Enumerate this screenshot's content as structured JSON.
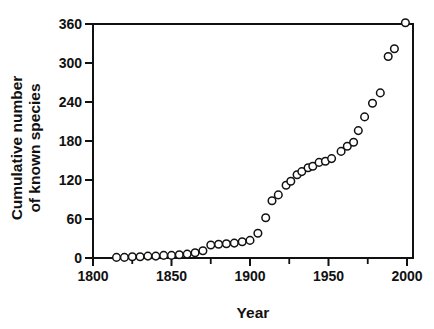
{
  "figure": {
    "background": "#ffffff",
    "ink": "#111111"
  },
  "chart_data": {
    "type": "scatter",
    "title": "",
    "xlabel": "Year",
    "ylabel": "Cumulative number of known species",
    "ylabel_lines": [
      "Cumulative number",
      "of known species"
    ],
    "xlim": [
      1800,
      2000
    ],
    "ylim": [
      0,
      360
    ],
    "xticks": [
      1800,
      1850,
      1900,
      1950,
      2000
    ],
    "xticks_minor": [
      1825,
      1875,
      1925,
      1975
    ],
    "yticks": [
      0,
      60,
      120,
      180,
      240,
      300,
      360
    ],
    "grid": false,
    "legend": "none",
    "marker": "open-circle",
    "marker_color": "#111111",
    "marker_fill": "#ffffff",
    "series": [
      {
        "name": "Cumulative known species",
        "points": [
          [
            1815,
            1
          ],
          [
            1820,
            1
          ],
          [
            1825,
            2
          ],
          [
            1830,
            2
          ],
          [
            1835,
            3
          ],
          [
            1840,
            3
          ],
          [
            1845,
            4
          ],
          [
            1850,
            4
          ],
          [
            1855,
            5
          ],
          [
            1860,
            6
          ],
          [
            1865,
            8
          ],
          [
            1870,
            11
          ],
          [
            1875,
            20
          ],
          [
            1880,
            21
          ],
          [
            1885,
            22
          ],
          [
            1890,
            23
          ],
          [
            1895,
            25
          ],
          [
            1900,
            27
          ],
          [
            1905,
            38
          ],
          [
            1910,
            62
          ],
          [
            1914,
            88
          ],
          [
            1918,
            97
          ],
          [
            1923,
            112
          ],
          [
            1926,
            118
          ],
          [
            1930,
            128
          ],
          [
            1933,
            133
          ],
          [
            1937,
            139
          ],
          [
            1940,
            141
          ],
          [
            1944,
            147
          ],
          [
            1948,
            149
          ],
          [
            1952,
            153
          ],
          [
            1958,
            164
          ],
          [
            1962,
            172
          ],
          [
            1966,
            178
          ],
          [
            1969,
            196
          ],
          [
            1973,
            217
          ],
          [
            1978,
            238
          ],
          [
            1983,
            254
          ],
          [
            1988,
            310
          ],
          [
            1992,
            322
          ],
          [
            1999,
            362
          ]
        ]
      }
    ]
  }
}
